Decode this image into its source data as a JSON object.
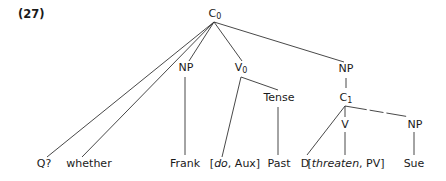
{
  "example_number": "(27)",
  "nodes": {
    "root": {
      "cat": "C",
      "sub": "0"
    },
    "np_subject": {
      "cat": "NP"
    },
    "v0": {
      "cat": "V",
      "sub": "0"
    },
    "tense": {
      "cat": "Tense"
    },
    "np_object": {
      "cat": "NP"
    },
    "c1": {
      "cat": "C",
      "sub": "1"
    },
    "v": {
      "cat": "V"
    },
    "np_inner": {
      "cat": "NP"
    }
  },
  "leaves": {
    "q": "Q?",
    "whether": "whether",
    "frank": "Frank",
    "do_open": "[",
    "do_word": "do",
    "do_rest": ", Aux]",
    "past": "Past",
    "d": "D",
    "threaten_open": "[",
    "threaten_word": "threaten",
    "threaten_rest": ", PV]",
    "sue": "Sue"
  },
  "colors": {
    "line": "#333333",
    "text": "#1a1a1a",
    "background": "#ffffff"
  }
}
